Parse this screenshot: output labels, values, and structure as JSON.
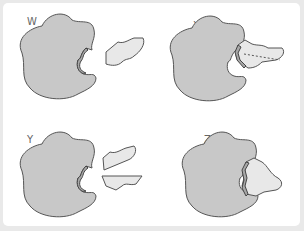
{
  "diagram": {
    "panels": [
      {
        "id": "W",
        "label": "W",
        "description": "enzyme with empty active site; substrate separate"
      },
      {
        "id": "X",
        "label": "X",
        "description": "substrate bound in active site; bond being broken (dashed line)"
      },
      {
        "id": "Y",
        "label": "Y",
        "description": "two product fragments released from enzyme"
      },
      {
        "id": "Z",
        "label": "Z",
        "description": "substrate bound in active site"
      }
    ],
    "colors": {
      "background": "#e9e9e9",
      "panel": "#ffffff",
      "enzyme": "#c8c8c8",
      "substrate": "#e8e8e8",
      "outline": "#555555"
    }
  }
}
